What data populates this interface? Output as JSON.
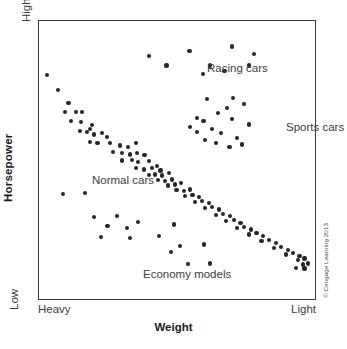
{
  "figure": {
    "credit": "© Cengage Learning 2013",
    "background_color": "#ffffff",
    "frame_color": "#3a3a3a",
    "point_color": "#262626",
    "text_color": "#3c3c3c"
  },
  "axes": {
    "x_title": "Weight",
    "y_title": "Horsepower",
    "x_left_label": "Heavy",
    "x_right_label": "Light",
    "y_bottom_label": "Low",
    "y_top_label": "High"
  },
  "annotations": [
    {
      "id": "racing",
      "label": "Racing cars",
      "x": 0.47,
      "y": 0.93
    },
    {
      "id": "sports",
      "label": "Sports cars",
      "x": 0.75,
      "y": 0.72
    },
    {
      "id": "normal",
      "label": "Normal cars",
      "x": 0.06,
      "y": 0.53
    },
    {
      "id": "economy",
      "label": "Economy models",
      "x": 0.24,
      "y": 0.19
    }
  ],
  "chart_data": {
    "type": "scatter",
    "title": "",
    "subtitle": "",
    "xlabel": "Weight",
    "ylabel": "Horsepower",
    "xlim": [
      0,
      1
    ],
    "ylim": [
      0,
      1
    ],
    "x_axis_direction": "Heavy (left) to Light (right)",
    "y_axis_direction": "Low (bottom) to High (top)",
    "x_tick_labels": [
      "Heavy",
      "Light"
    ],
    "y_tick_labels": [
      "Low",
      "High"
    ],
    "grid": false,
    "legend": false,
    "annotations": [
      "Racing cars",
      "Sports cars",
      "Normal cars",
      "Economy models"
    ],
    "series": [
      {
        "name": "Normal cars",
        "note": "Main downward-sloping band from heavy/high-power to light/low-power",
        "points": [
          [
            0.028,
            0.805
          ],
          [
            0.07,
            0.752
          ],
          [
            0.107,
            0.704
          ],
          [
            0.094,
            0.672
          ],
          [
            0.135,
            0.672
          ],
          [
            0.155,
            0.672
          ],
          [
            0.117,
            0.64
          ],
          [
            0.153,
            0.638
          ],
          [
            0.192,
            0.625
          ],
          [
            0.15,
            0.603
          ],
          [
            0.175,
            0.6
          ],
          [
            0.185,
            0.612
          ],
          [
            0.2,
            0.592
          ],
          [
            0.228,
            0.597
          ],
          [
            0.246,
            0.583
          ],
          [
            0.185,
            0.565
          ],
          [
            0.212,
            0.562
          ],
          [
            0.258,
            0.56
          ],
          [
            0.293,
            0.552
          ],
          [
            0.322,
            0.548
          ],
          [
            0.352,
            0.56
          ],
          [
            0.268,
            0.53
          ],
          [
            0.3,
            0.524
          ],
          [
            0.33,
            0.52
          ],
          [
            0.356,
            0.525
          ],
          [
            0.382,
            0.518
          ],
          [
            0.3,
            0.498
          ],
          [
            0.336,
            0.5
          ],
          [
            0.36,
            0.492
          ],
          [
            0.398,
            0.497
          ],
          [
            0.352,
            0.47
          ],
          [
            0.38,
            0.466
          ],
          [
            0.41,
            0.47
          ],
          [
            0.428,
            0.478
          ],
          [
            0.44,
            0.462
          ],
          [
            0.398,
            0.446
          ],
          [
            0.42,
            0.448
          ],
          [
            0.446,
            0.444
          ],
          [
            0.47,
            0.452
          ],
          [
            0.432,
            0.428
          ],
          [
            0.456,
            0.424
          ],
          [
            0.482,
            0.43
          ],
          [
            0.468,
            0.408
          ],
          [
            0.492,
            0.412
          ],
          [
            0.515,
            0.416
          ],
          [
            0.498,
            0.392
          ],
          [
            0.524,
            0.388
          ],
          [
            0.548,
            0.394
          ],
          [
            0.53,
            0.37
          ],
          [
            0.556,
            0.374
          ],
          [
            0.58,
            0.366
          ],
          [
            0.565,
            0.348
          ],
          [
            0.592,
            0.352
          ],
          [
            0.616,
            0.344
          ],
          [
            0.6,
            0.326
          ],
          [
            0.628,
            0.33
          ],
          [
            0.652,
            0.322
          ],
          [
            0.64,
            0.302
          ],
          [
            0.668,
            0.306
          ],
          [
            0.692,
            0.298
          ],
          [
            0.678,
            0.28
          ],
          [
            0.706,
            0.284
          ],
          [
            0.73,
            0.274
          ],
          [
            0.716,
            0.256
          ],
          [
            0.744,
            0.26
          ],
          [
            0.768,
            0.25
          ],
          [
            0.76,
            0.232
          ],
          [
            0.788,
            0.236
          ],
          [
            0.812,
            0.226
          ],
          [
            0.806,
            0.208
          ],
          [
            0.834,
            0.212
          ],
          [
            0.858,
            0.2
          ],
          [
            0.852,
            0.182
          ],
          [
            0.878,
            0.188
          ],
          [
            0.902,
            0.176
          ],
          [
            0.896,
            0.16
          ],
          [
            0.92,
            0.166
          ],
          [
            0.944,
            0.154
          ],
          [
            0.938,
            0.14
          ],
          [
            0.962,
            0.146
          ],
          [
            0.956,
            0.124
          ],
          [
            0.975,
            0.128
          ],
          [
            0.93,
            0.112
          ],
          [
            0.962,
            0.11
          ]
        ]
      },
      {
        "name": "Racing cars",
        "note": "High horsepower cluster, top of plot",
        "points": [
          [
            0.4,
            0.875
          ],
          [
            0.462,
            0.84
          ],
          [
            0.545,
            0.892
          ],
          [
            0.62,
            0.84
          ],
          [
            0.7,
            0.908
          ],
          [
            0.778,
            0.88
          ],
          [
            0.762,
            0.84
          ],
          [
            0.595,
            0.808
          ],
          [
            0.672,
            0.82
          ]
        ]
      },
      {
        "name": "Sports cars",
        "note": "Mid-to-high horsepower cluster in light-weight region",
        "points": [
          [
            0.61,
            0.718
          ],
          [
            0.702,
            0.722
          ],
          [
            0.744,
            0.7
          ],
          [
            0.65,
            0.668
          ],
          [
            0.682,
            0.688
          ],
          [
            0.572,
            0.652
          ],
          [
            0.596,
            0.64
          ],
          [
            0.7,
            0.648
          ],
          [
            0.762,
            0.628
          ],
          [
            0.548,
            0.618
          ],
          [
            0.572,
            0.6
          ],
          [
            0.628,
            0.612
          ],
          [
            0.66,
            0.596
          ],
          [
            0.716,
            0.58
          ],
          [
            0.6,
            0.572
          ],
          [
            0.64,
            0.562
          ],
          [
            0.69,
            0.548
          ],
          [
            0.736,
            0.556
          ]
        ]
      },
      {
        "name": "Economy models",
        "note": "Low horsepower scattered points, lower half of plot",
        "points": [
          [
            0.088,
            0.378
          ],
          [
            0.168,
            0.382
          ],
          [
            0.198,
            0.296
          ],
          [
            0.284,
            0.3
          ],
          [
            0.248,
            0.262
          ],
          [
            0.318,
            0.254
          ],
          [
            0.36,
            0.278
          ],
          [
            0.226,
            0.224
          ],
          [
            0.33,
            0.218
          ],
          [
            0.436,
            0.226
          ],
          [
            0.488,
            0.268
          ],
          [
            0.512,
            0.192
          ],
          [
            0.478,
            0.168
          ],
          [
            0.54,
            0.126
          ],
          [
            0.62,
            0.128
          ],
          [
            0.598,
            0.196
          ]
        ]
      }
    ]
  }
}
